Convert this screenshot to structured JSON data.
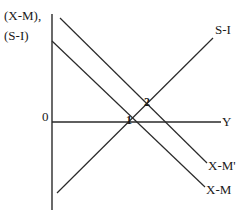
{
  "diagram": {
    "y_axis_label_line1": "(X-M),",
    "y_axis_label_line2": "(S-I)",
    "origin_label": "0",
    "x_axis_label": "Y",
    "curves": [
      {
        "name": "S-I",
        "label": "S-I",
        "x1": 57,
        "y1": 193,
        "x2": 213,
        "y2": 38
      },
      {
        "name": "X-M",
        "label": "X-M",
        "x1": 52,
        "y1": 41,
        "x2": 205,
        "y2": 187
      },
      {
        "name": "X-M'",
        "label": "X-M'",
        "x1": 60,
        "y1": 18,
        "x2": 207,
        "y2": 163
      }
    ],
    "points": [
      {
        "label": "1"
      },
      {
        "label": "2"
      }
    ],
    "colors": {
      "line": "#2a2a2a",
      "background": "#ffffff"
    }
  }
}
